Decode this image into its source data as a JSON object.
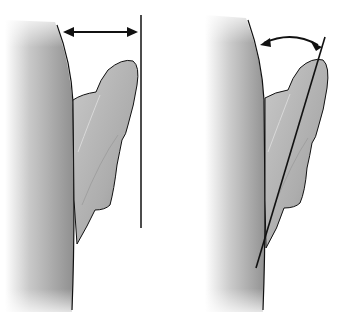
{
  "diagram": {
    "panels": [
      {
        "id": "left",
        "measurement": "distance",
        "indicator": "horizontal double-headed arrow to vertical reference line"
      },
      {
        "id": "right",
        "measurement": "angle",
        "indicator": "curved double-headed arrow to slanted line along ear"
      }
    ],
    "colors": {
      "background": "#ffffff",
      "head_dark": "#8a8a8a",
      "head_light": "#ffffff",
      "ear_fill": "#b5b5b5",
      "ear_highlight": "#d6d6d6",
      "stroke": "#111111"
    }
  }
}
